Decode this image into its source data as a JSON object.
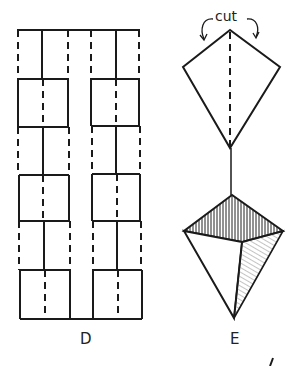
{
  "figures": {
    "D": {
      "label": "D",
      "description": "Folding grid: two columns of rectangles with alternating solid (cut) and dashed (fold) lines",
      "rows": 6,
      "blocks": 2
    },
    "E": {
      "label": "E",
      "annotation": "cut",
      "description": "Kite-shaped folded piece connected by a stem to a shaded pyramid/diamond shape"
    }
  },
  "corner_mark": "/",
  "colors": {
    "ink": "#1a1a1a",
    "paper": "#ffffff"
  }
}
